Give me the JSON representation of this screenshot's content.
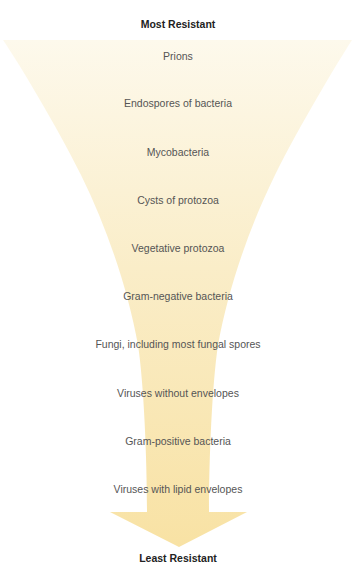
{
  "diagram": {
    "type": "resistance-funnel",
    "top_label": "Most Resistant",
    "bottom_label": "Least Resistant",
    "fill_colors": {
      "top": "#fdf8ea",
      "bottom": "#f8e3a6"
    },
    "items": [
      {
        "label": "Prions"
      },
      {
        "label": "Endospores of bacteria"
      },
      {
        "label": "Mycobacteria"
      },
      {
        "label": "Cysts of protozoa"
      },
      {
        "label": "Vegetative protozoa"
      },
      {
        "label": "Gram-negative bacteria"
      },
      {
        "label": "Fungi, including most fungal spores"
      },
      {
        "label": "Viruses without envelopes"
      },
      {
        "label": "Gram-positive bacteria"
      },
      {
        "label": "Viruses with lipid envelopes"
      }
    ]
  }
}
